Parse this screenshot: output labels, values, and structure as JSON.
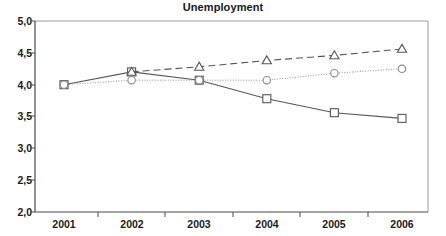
{
  "chart_data": {
    "type": "line",
    "title": "Unemployment",
    "xlabel": "",
    "ylabel": "",
    "categories": [
      "2001",
      "2002",
      "2003",
      "2004",
      "2005",
      "2006"
    ],
    "ylim": [
      2.0,
      5.0
    ],
    "ytick_labels": [
      "2,0",
      "2,5",
      "3,0",
      "3,5",
      "4,0",
      "4,5",
      "5,0"
    ],
    "ytick_values": [
      2.0,
      2.5,
      3.0,
      3.5,
      4.0,
      4.5,
      5.0
    ],
    "grid": false,
    "legend": "none",
    "decimal_separator": ",",
    "series": [
      {
        "name": "series-square",
        "marker": "square",
        "line_style": "solid",
        "color": "#555555",
        "x": [
          "2001",
          "2002",
          "2003",
          "2004",
          "2005",
          "2006"
        ],
        "values": [
          4.0,
          4.2,
          4.07,
          3.78,
          3.56,
          3.47
        ]
      },
      {
        "name": "series-circle",
        "marker": "circle",
        "line_style": "dotted",
        "color": "#888888",
        "x": [
          "2001",
          "2002",
          "2003",
          "2004",
          "2005",
          "2006"
        ],
        "values": [
          4.0,
          4.07,
          4.07,
          4.07,
          4.18,
          4.25
        ]
      },
      {
        "name": "series-triangle",
        "marker": "triangle",
        "line_style": "dashed",
        "color": "#555555",
        "x": [
          "2002",
          "2003",
          "2004",
          "2005",
          "2006"
        ],
        "values": [
          4.2,
          4.28,
          4.38,
          4.46,
          4.56
        ]
      }
    ]
  },
  "axes": {
    "y_labels": [
      "5,0",
      "4,5",
      "4,0",
      "3,5",
      "3,0",
      "2,5",
      "2,0"
    ],
    "x_labels": [
      "2001",
      "2002",
      "2003",
      "2004",
      "2005",
      "2006"
    ]
  }
}
